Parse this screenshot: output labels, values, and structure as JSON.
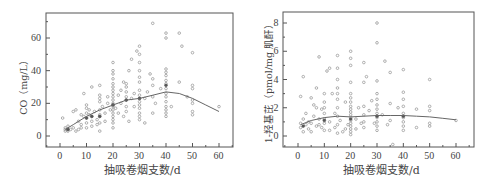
{
  "chart_data": [
    {
      "type": "scatter",
      "title": "",
      "xlabel": "抽吸卷烟支数/d",
      "ylabel": "CO（mg/L）",
      "xlim": [
        -5,
        65
      ],
      "ylim": [
        -6,
        74
      ],
      "xticks": [
        0,
        10,
        20,
        30,
        40,
        50,
        60
      ],
      "yticks": [
        0,
        20,
        40,
        60
      ],
      "grid": false,
      "legend": "none",
      "trend_line": {
        "x": [
          2,
          5,
          10,
          15,
          20,
          25,
          30,
          35,
          40,
          45,
          50,
          55,
          60
        ],
        "y": [
          4,
          7,
          12,
          16,
          19,
          22,
          23,
          25,
          27,
          26,
          23,
          19,
          15
        ]
      },
      "points": [
        [
          1,
          11
        ],
        [
          2,
          3
        ],
        [
          2,
          4
        ],
        [
          2,
          5
        ],
        [
          3,
          3
        ],
        [
          3,
          4
        ],
        [
          3,
          6
        ],
        [
          4,
          4
        ],
        [
          5,
          15
        ],
        [
          5,
          5
        ],
        [
          6,
          3
        ],
        [
          6,
          16
        ],
        [
          7,
          4
        ],
        [
          7,
          9
        ],
        [
          8,
          5
        ],
        [
          8,
          13
        ],
        [
          8,
          7
        ],
        [
          9,
          26
        ],
        [
          9,
          12
        ],
        [
          10,
          11
        ],
        [
          10,
          14
        ],
        [
          10,
          17
        ],
        [
          10,
          19
        ],
        [
          10,
          8
        ],
        [
          10,
          5
        ],
        [
          11,
          16
        ],
        [
          11,
          13
        ],
        [
          12,
          12
        ],
        [
          12,
          9
        ],
        [
          12,
          6
        ],
        [
          12,
          30
        ],
        [
          13,
          15
        ],
        [
          14,
          10
        ],
        [
          14,
          7
        ],
        [
          15,
          12
        ],
        [
          15,
          13
        ],
        [
          15,
          16
        ],
        [
          15,
          21
        ],
        [
          15,
          23
        ],
        [
          15,
          25
        ],
        [
          15,
          31
        ],
        [
          15,
          3
        ],
        [
          15,
          8
        ],
        [
          16,
          18
        ],
        [
          17,
          9
        ],
        [
          17,
          14
        ],
        [
          18,
          20
        ],
        [
          18,
          24
        ],
        [
          19,
          16
        ],
        [
          20,
          5
        ],
        [
          20,
          8
        ],
        [
          20,
          10
        ],
        [
          20,
          12
        ],
        [
          20,
          14
        ],
        [
          20,
          16
        ],
        [
          20,
          18
        ],
        [
          20,
          19
        ],
        [
          20,
          20
        ],
        [
          20,
          22
        ],
        [
          20,
          24
        ],
        [
          20,
          26
        ],
        [
          20,
          28
        ],
        [
          20,
          30
        ],
        [
          20,
          32
        ],
        [
          20,
          35
        ],
        [
          20,
          38
        ],
        [
          20,
          40
        ],
        [
          20,
          45
        ],
        [
          21,
          17
        ],
        [
          22,
          25
        ],
        [
          22,
          14
        ],
        [
          23,
          20
        ],
        [
          23,
          28
        ],
        [
          24,
          12
        ],
        [
          24,
          33
        ],
        [
          25,
          15
        ],
        [
          25,
          18
        ],
        [
          25,
          22
        ],
        [
          25,
          24
        ],
        [
          25,
          27
        ],
        [
          25,
          30
        ],
        [
          25,
          32
        ],
        [
          26,
          9
        ],
        [
          26,
          40
        ],
        [
          27,
          23
        ],
        [
          27,
          47
        ],
        [
          28,
          18
        ],
        [
          28,
          26
        ],
        [
          29,
          52
        ],
        [
          30,
          10
        ],
        [
          30,
          12
        ],
        [
          30,
          14
        ],
        [
          30,
          17
        ],
        [
          30,
          19
        ],
        [
          30,
          21
        ],
        [
          30,
          23
        ],
        [
          30,
          25
        ],
        [
          30,
          28
        ],
        [
          30,
          33
        ],
        [
          30,
          36
        ],
        [
          30,
          40
        ],
        [
          30,
          45
        ],
        [
          30,
          50
        ],
        [
          30,
          55
        ],
        [
          32,
          8
        ],
        [
          32,
          23
        ],
        [
          33,
          27
        ],
        [
          34,
          38
        ],
        [
          35,
          14
        ],
        [
          35,
          24
        ],
        [
          35,
          31
        ],
        [
          35,
          35
        ],
        [
          35,
          69
        ],
        [
          36,
          20
        ],
        [
          38,
          29
        ],
        [
          40,
          12
        ],
        [
          40,
          14
        ],
        [
          40,
          16
        ],
        [
          40,
          18
        ],
        [
          40,
          21
        ],
        [
          40,
          24
        ],
        [
          40,
          26
        ],
        [
          40,
          29
        ],
        [
          40,
          32
        ],
        [
          40,
          34
        ],
        [
          40,
          37
        ],
        [
          40,
          39
        ],
        [
          40,
          41
        ],
        [
          40,
          60
        ],
        [
          40,
          63
        ],
        [
          42,
          18
        ],
        [
          45,
          33
        ],
        [
          45,
          63
        ],
        [
          46,
          55
        ],
        [
          48,
          24
        ],
        [
          50,
          13
        ],
        [
          50,
          15
        ],
        [
          50,
          20
        ],
        [
          50,
          22
        ],
        [
          50,
          29
        ],
        [
          50,
          31
        ],
        [
          50,
          51
        ],
        [
          60,
          18
        ]
      ],
      "highlight_points": [
        [
          12,
          12
        ],
        [
          10,
          11
        ],
        [
          15,
          12
        ],
        [
          20,
          19
        ],
        [
          25,
          22
        ],
        [
          30,
          23
        ],
        [
          40,
          31
        ],
        [
          3,
          4
        ]
      ]
    },
    {
      "type": "scatter",
      "title": "",
      "xlabel": "抽吸卷烟支数/d",
      "ylabel": "1-羟基芘（pmol/mg 肌酐）",
      "xlim": [
        -5,
        65
      ],
      "ylim": [
        -0.8,
        8.8
      ],
      "xticks": [
        0,
        10,
        20,
        30,
        40,
        50,
        60
      ],
      "yticks": [
        0,
        2,
        4,
        6,
        8
      ],
      "grid": false,
      "legend": "none",
      "trend_line": {
        "x": [
          1,
          5,
          10,
          15,
          20,
          25,
          30,
          35,
          40,
          45,
          50,
          55,
          60
        ],
        "y": [
          0.8,
          1.1,
          1.3,
          1.4,
          1.35,
          1.4,
          1.45,
          1.45,
          1.45,
          1.4,
          1.35,
          1.25,
          1.15
        ]
      },
      "points": [
        [
          1,
          0.6
        ],
        [
          1,
          0.9
        ],
        [
          1,
          2.8
        ],
        [
          2,
          4.2
        ],
        [
          2,
          0.3
        ],
        [
          2,
          1.2
        ],
        [
          3,
          0.8
        ],
        [
          3,
          1.6
        ],
        [
          4,
          0.5
        ],
        [
          4,
          1.0
        ],
        [
          5,
          2.7
        ],
        [
          5,
          0.9
        ],
        [
          5,
          0.3
        ],
        [
          6,
          2.2
        ],
        [
          6,
          1.4
        ],
        [
          7,
          3.4
        ],
        [
          7,
          0.7
        ],
        [
          7,
          2.0
        ],
        [
          8,
          5.6
        ],
        [
          8,
          0.8
        ],
        [
          8,
          1.2
        ],
        [
          9,
          0.6
        ],
        [
          9,
          1.9
        ],
        [
          10,
          0.4
        ],
        [
          10,
          0.9
        ],
        [
          10,
          1.2
        ],
        [
          10,
          1.6
        ],
        [
          10,
          2.0
        ],
        [
          10,
          2.4
        ],
        [
          10,
          3.0
        ],
        [
          11,
          4.6
        ],
        [
          12,
          4.8
        ],
        [
          12,
          1.0
        ],
        [
          12,
          0.4
        ],
        [
          13,
          3.0
        ],
        [
          14,
          0.6
        ],
        [
          14,
          1.6
        ],
        [
          15,
          0.2
        ],
        [
          15,
          0.8
        ],
        [
          15,
          1.4
        ],
        [
          15,
          2.0
        ],
        [
          15,
          2.6
        ],
        [
          15,
          3.0
        ],
        [
          15,
          3.4
        ],
        [
          15,
          4.0
        ],
        [
          15,
          4.8
        ],
        [
          15,
          5.7
        ],
        [
          16,
          1.1
        ],
        [
          17,
          0.3
        ],
        [
          18,
          0.5
        ],
        [
          18,
          2.4
        ],
        [
          19,
          0.8
        ],
        [
          20,
          0.1
        ],
        [
          20,
          0.3
        ],
        [
          20,
          0.5
        ],
        [
          20,
          0.7
        ],
        [
          20,
          0.9
        ],
        [
          20,
          1.1
        ],
        [
          20,
          1.3
        ],
        [
          20,
          1.5
        ],
        [
          20,
          1.7
        ],
        [
          20,
          1.9
        ],
        [
          20,
          2.1
        ],
        [
          20,
          2.4
        ],
        [
          20,
          2.7
        ],
        [
          20,
          3.0
        ],
        [
          20,
          3.8
        ],
        [
          20,
          5.0
        ],
        [
          20,
          5.5
        ],
        [
          20,
          6.0
        ],
        [
          22,
          1.2
        ],
        [
          22,
          0.5
        ],
        [
          23,
          2.0
        ],
        [
          24,
          0.9
        ],
        [
          25,
          0.6
        ],
        [
          25,
          1.0
        ],
        [
          25,
          1.5
        ],
        [
          25,
          2.1
        ],
        [
          25,
          3.8
        ],
        [
          25,
          5.2
        ],
        [
          26,
          4.2
        ],
        [
          27,
          1.8
        ],
        [
          28,
          2.5
        ],
        [
          29,
          0.9
        ],
        [
          30,
          0.4
        ],
        [
          30,
          0.7
        ],
        [
          30,
          1.0
        ],
        [
          30,
          1.3
        ],
        [
          30,
          1.6
        ],
        [
          30,
          1.9
        ],
        [
          30,
          2.2
        ],
        [
          30,
          2.6
        ],
        [
          30,
          3.0
        ],
        [
          30,
          3.9
        ],
        [
          30,
          6.6
        ],
        [
          30,
          8.0
        ],
        [
          32,
          1.5
        ],
        [
          33,
          5.3
        ],
        [
          34,
          0.8
        ],
        [
          35,
          2.3
        ],
        [
          35,
          4.5
        ],
        [
          35,
          1.1
        ],
        [
          36,
          -0.6
        ],
        [
          38,
          2.0
        ],
        [
          40,
          0.4
        ],
        [
          40,
          0.7
        ],
        [
          40,
          1.0
        ],
        [
          40,
          1.3
        ],
        [
          40,
          1.6
        ],
        [
          40,
          2.1
        ],
        [
          40,
          2.6
        ],
        [
          40,
          3.1
        ],
        [
          40,
          4.7
        ],
        [
          45,
          0.6
        ],
        [
          45,
          1.9
        ],
        [
          50,
          0.7
        ],
        [
          50,
          0.9
        ],
        [
          50,
          1.8
        ],
        [
          50,
          2.1
        ],
        [
          50,
          4.0
        ],
        [
          60,
          1.1
        ]
      ],
      "highlight_points": [
        [
          2,
          0.7
        ],
        [
          10,
          1.1
        ],
        [
          20,
          1.2
        ],
        [
          30,
          1.4
        ],
        [
          40,
          1.4
        ]
      ]
    }
  ],
  "colors": {
    "axis": "#555555",
    "point": "#9a9a9a",
    "point_dark": "#555555",
    "trend": "#666666"
  }
}
